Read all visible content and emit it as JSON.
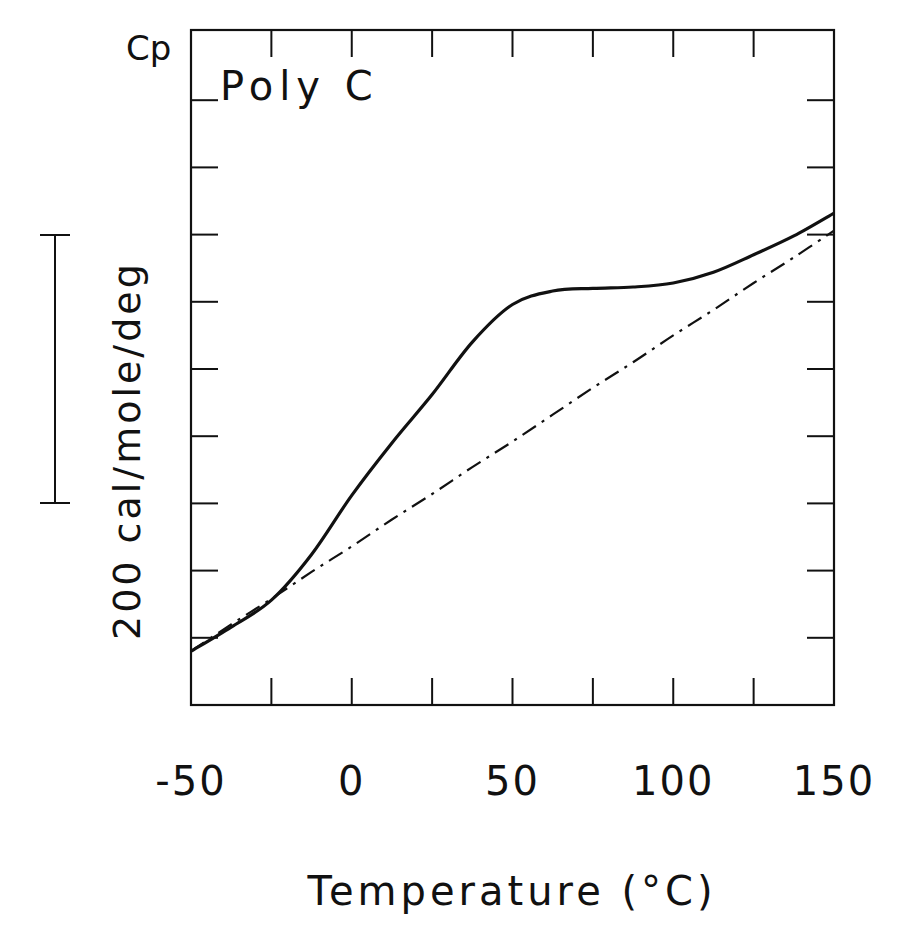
{
  "chart_data": {
    "type": "line",
    "title": "Poly C",
    "xlabel": "Temperature (°C)",
    "ylabel": "Cp",
    "scale_bar_label": "200 cal/mole/deg",
    "scale_bar_value": 200,
    "xlim": [
      -50,
      150
    ],
    "ylim": [
      0,
      500
    ],
    "x_ticks": [
      -50,
      0,
      50,
      100,
      150
    ],
    "x_minor_step": 25,
    "y_tick_step": 50,
    "y_tick_labels_shown": false,
    "grid": false,
    "legend": null,
    "x": [
      -50,
      -37.5,
      -25,
      -12.5,
      0,
      12.5,
      25,
      37.5,
      50,
      62.5,
      75,
      87.5,
      100,
      112.5,
      125,
      137.5,
      150
    ],
    "series": [
      {
        "name": "measured Cp (solid curve with data dots)",
        "style": "solid",
        "values": [
          40,
          58,
          78,
          112,
          156,
          195,
          231,
          270,
          298,
          308,
          310,
          311,
          314,
          322,
          335,
          349,
          366
        ]
      },
      {
        "name": "baseline (dash-dot)",
        "style": "dashdot",
        "values": [
          40,
          60,
          79,
          99,
          118,
          138,
          157,
          177,
          196,
          216,
          236,
          255,
          275,
          294,
          314,
          333,
          353
        ]
      }
    ],
    "units_note": "y values are relative Cp in cal/mole/deg measured from bottom of plot frame (absolute offset not labeled)"
  },
  "labels": {
    "y_axis_symbol": "Cp",
    "inset_title": "Poly C",
    "scale_bar_text": "200 cal/mole/deg",
    "x_axis_title": "Temperature (°C)",
    "x_tick_labels": [
      "-50",
      "0",
      "50",
      "100",
      "150"
    ]
  }
}
